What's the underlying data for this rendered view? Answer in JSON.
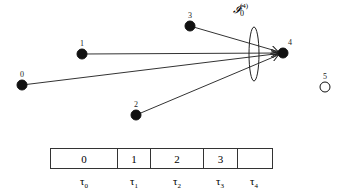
{
  "diagram": {
    "set_label": {
      "symbol": "𝓘",
      "subscript": "0",
      "superscript": "(4)"
    },
    "nodes": [
      {
        "id": "0",
        "label": "0",
        "x": 22,
        "y": 85,
        "filled": true
      },
      {
        "id": "1",
        "label": "1",
        "x": 82,
        "y": 54,
        "filled": true
      },
      {
        "id": "2",
        "label": "2",
        "x": 136,
        "y": 115,
        "filled": true
      },
      {
        "id": "3",
        "label": "3",
        "x": 190,
        "y": 26,
        "filled": true
      },
      {
        "id": "4",
        "label": "4",
        "x": 283,
        "y": 53,
        "filled": true
      },
      {
        "id": "5",
        "label": "5",
        "x": 325,
        "y": 87,
        "filled": false
      }
    ],
    "edges": [
      {
        "from": "0",
        "to": "4"
      },
      {
        "from": "1",
        "to": "4"
      },
      {
        "from": "2",
        "to": "4"
      },
      {
        "from": "3",
        "to": "4"
      }
    ],
    "interference_ellipse": {
      "cx": 254,
      "cy": 54,
      "rx": 5,
      "ry": 27
    }
  },
  "schedule": {
    "slots": [
      {
        "value": "0",
        "width": 67
      },
      {
        "value": "1",
        "width": 33
      },
      {
        "value": "2",
        "width": 53
      },
      {
        "value": "3",
        "width": 34
      },
      {
        "value": "",
        "width": 34
      }
    ],
    "times": [
      {
        "symbol": "τ",
        "sub": "0",
        "x": 84
      },
      {
        "symbol": "τ",
        "sub": "1",
        "x": 134
      },
      {
        "symbol": "τ",
        "sub": "2",
        "x": 177
      },
      {
        "symbol": "τ",
        "sub": "3",
        "x": 220
      },
      {
        "symbol": "τ",
        "sub": "4",
        "x": 254
      }
    ]
  }
}
